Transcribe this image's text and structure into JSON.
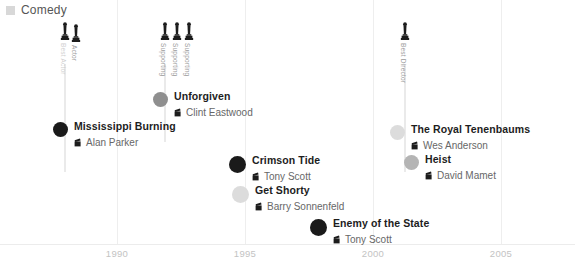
{
  "legend": {
    "swatch_color": "#d8d8d8",
    "label": "Comedy"
  },
  "axis": {
    "ticks": [
      {
        "label": "1990",
        "x": 117
      },
      {
        "label": "1995",
        "x": 245
      },
      {
        "label": "2000",
        "x": 373
      },
      {
        "label": "2005",
        "x": 501
      }
    ]
  },
  "awards": [
    {
      "label": "Best Actor",
      "icon": "oscar-statuette-icon",
      "x": 60,
      "top": 22,
      "stem_height": 108,
      "dim": true
    },
    {
      "label": "Actor",
      "icon": "oscar-statuette-icon",
      "x": 71,
      "top": 24,
      "stem_height": 0,
      "dim": false
    },
    {
      "label": "Supporting",
      "icon": "oscar-statuette-icon",
      "x": 160,
      "top": 22,
      "stem_height": 78,
      "dim": false
    },
    {
      "label": "Supporting",
      "icon": "oscar-statuette-icon",
      "x": 172,
      "top": 22,
      "stem_height": 0,
      "dim": false
    },
    {
      "label": "Supporting",
      "icon": "oscar-statuette-icon",
      "x": 184,
      "top": 22,
      "stem_height": 0,
      "dim": false
    },
    {
      "label": "Best Director",
      "icon": "oscar-statuette-icon",
      "x": 400,
      "top": 22,
      "stem_height": 108,
      "dim": false
    }
  ],
  "films": [
    {
      "title": "Mississippi Burning",
      "director": "Alan Parker",
      "node_color": "#1a1a1a",
      "node_size": 15,
      "x": 53,
      "y": 122
    },
    {
      "title": "Unforgiven",
      "director": "Clint Eastwood",
      "node_color": "#8f8f8f",
      "node_size": 15,
      "x": 153,
      "y": 92
    },
    {
      "title": "Crimson Tide",
      "director": "Tony Scott",
      "node_color": "#1a1a1a",
      "node_size": 17,
      "x": 229,
      "y": 156
    },
    {
      "title": "Get Shorty",
      "director": "Barry Sonnenfeld",
      "node_color": "#dcdcdc",
      "node_size": 17,
      "x": 232,
      "y": 186
    },
    {
      "title": "Enemy of the State",
      "director": "Tony Scott",
      "node_color": "#1a1a1a",
      "node_size": 17,
      "x": 310,
      "y": 219
    },
    {
      "title": "The Royal Tenenbaums",
      "director": "Wes Anderson",
      "node_color": "#dcdcdc",
      "node_size": 15,
      "x": 390,
      "y": 125
    },
    {
      "title": "Heist",
      "director": "David Mamet",
      "node_color": "#b4b4b4",
      "node_size": 15,
      "x": 404,
      "y": 155
    }
  ],
  "chart_data": {
    "type": "scatter",
    "title": "",
    "xlabel": "",
    "ylabel": "",
    "xlim": [
      1988,
      2006
    ],
    "xticks": [
      1990,
      1995,
      2000,
      2005
    ],
    "grid": true,
    "legend_position": "top-left",
    "legend_entries": [
      "Comedy"
    ],
    "points": [
      {
        "title": "Mississippi Burning",
        "director": "Alan Parker",
        "year": 1988,
        "color": "#1a1a1a"
      },
      {
        "title": "Unforgiven",
        "director": "Clint Eastwood",
        "year": 1992,
        "color": "#8f8f8f"
      },
      {
        "title": "Crimson Tide",
        "director": "Tony Scott",
        "year": 1995,
        "color": "#1a1a1a"
      },
      {
        "title": "Get Shorty",
        "director": "Barry Sonnenfeld",
        "year": 1995,
        "color": "#dcdcdc"
      },
      {
        "title": "Enemy of the State",
        "director": "Tony Scott",
        "year": 1998,
        "color": "#1a1a1a"
      },
      {
        "title": "The Royal Tenenbaums",
        "director": "Wes Anderson",
        "year": 2001,
        "color": "#dcdcdc"
      },
      {
        "title": "Heist",
        "director": "David Mamet",
        "year": 2001,
        "color": "#b4b4b4"
      }
    ],
    "annotations": [
      {
        "label": "Best Actor",
        "year": 1988
      },
      {
        "label": "Actor",
        "year": 1988
      },
      {
        "label": "Supporting",
        "year": 1992
      },
      {
        "label": "Supporting",
        "year": 1992
      },
      {
        "label": "Supporting",
        "year": 1992
      },
      {
        "label": "Best Director",
        "year": 2001
      }
    ]
  }
}
